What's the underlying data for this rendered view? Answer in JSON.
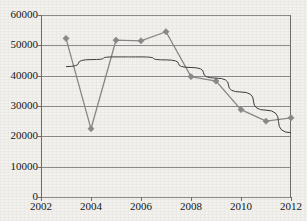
{
  "chart_data": {
    "type": "line",
    "title": "",
    "xlabel": "",
    "ylabel": "",
    "xlim": [
      2002,
      2012
    ],
    "ylim": [
      0,
      60000
    ],
    "grid": true,
    "legend": "none",
    "x_tick_labels": [
      "2002",
      "2004",
      "2006",
      "2008",
      "2010",
      "2012"
    ],
    "x_tick_values": [
      2002,
      2004,
      2006,
      2008,
      2010,
      2012
    ],
    "y_tick_labels": [
      "0",
      "10000",
      "20000",
      "30000",
      "40000",
      "50000",
      "60000"
    ],
    "y_tick_values": [
      0,
      10000,
      20000,
      30000,
      40000,
      50000,
      60000
    ],
    "x": [
      2003,
      2004,
      2005,
      2006,
      2007,
      2008,
      2009,
      2010,
      2011,
      2012
    ],
    "series": [
      {
        "name": "data-series",
        "marker": "diamond",
        "color": "#8a8a8a",
        "values": [
          52300,
          22500,
          51700,
          51500,
          54500,
          39700,
          38200,
          28800,
          25000,
          26100
        ]
      },
      {
        "name": "trendline",
        "marker": "none",
        "color": "#3d3d3d",
        "x": [
          2003,
          2004,
          2005,
          2006,
          2007,
          2008,
          2009,
          2010,
          2011,
          2012
        ],
        "values": [
          43000,
          45300,
          46200,
          46200,
          45200,
          42700,
          39200,
          34600,
          28600,
          21200
        ]
      }
    ]
  },
  "colors": {
    "background": "#f2f1ee",
    "gridline": "#8c8c8c",
    "axis": "#6f6f6f",
    "series": "#8a8a8a",
    "trendline": "#3d3d3d",
    "text": "#161616"
  }
}
